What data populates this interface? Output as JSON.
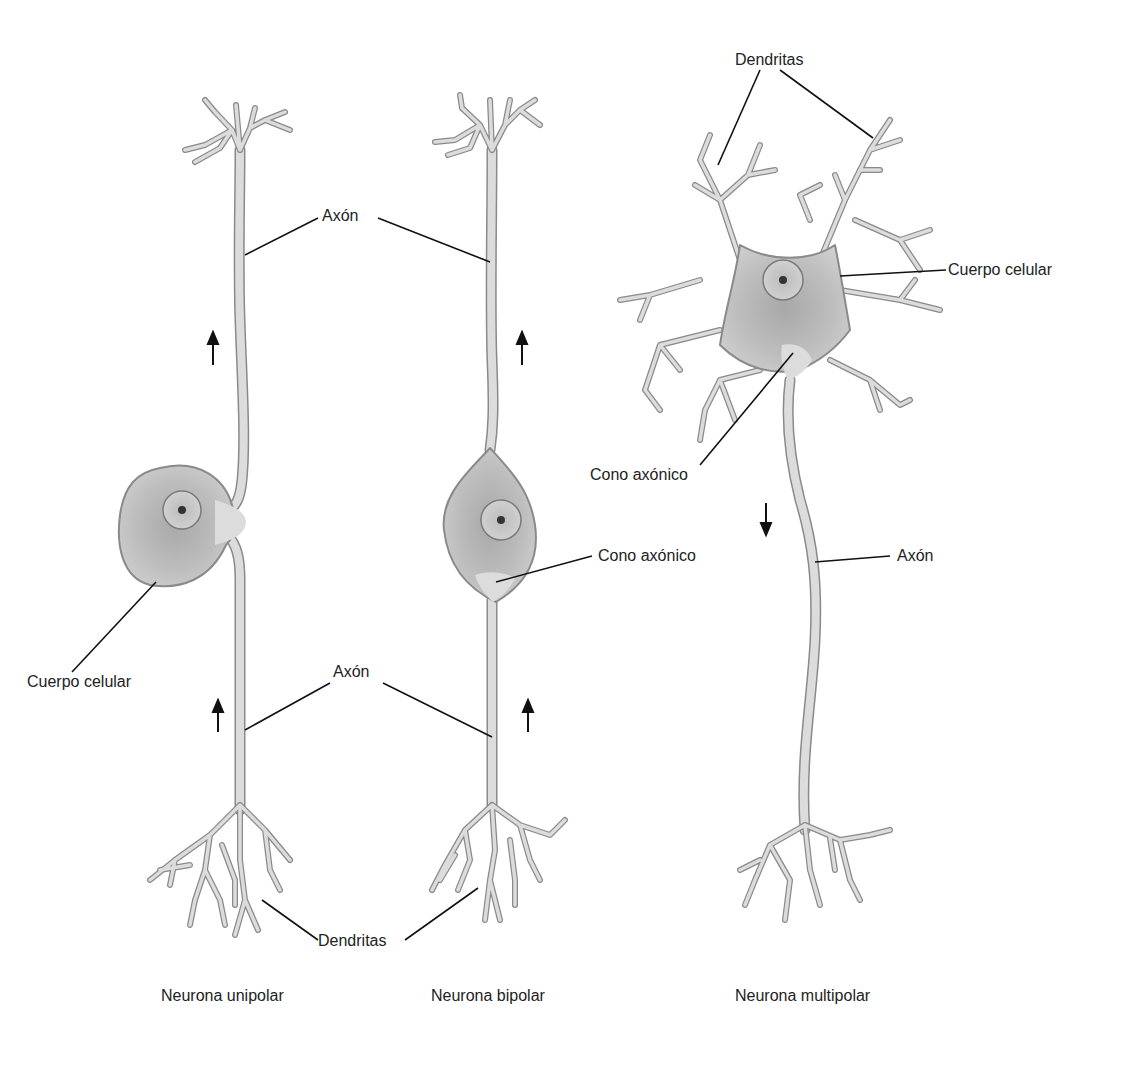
{
  "diagram": {
    "type": "neuron-types-illustration",
    "colors": {
      "membrane_fill": "#dcdcdc",
      "membrane_stroke": "#8a8a8a",
      "soma_fill": "#bdbdbd",
      "nucleus_fill": "#c9c9c9",
      "nucleolus": "#333333",
      "leader_line": "#111111",
      "text": "#222222",
      "background": "#ffffff"
    },
    "neurons": [
      {
        "id": "unipolar",
        "caption": "Neurona unipolar",
        "labels": {
          "axon_top": "Axón",
          "axon_bottom": "Axón",
          "soma": "Cuerpo celular",
          "dendrites": "Dendritas"
        },
        "arrows": [
          "up",
          "up"
        ]
      },
      {
        "id": "bipolar",
        "caption": "Neurona bipolar",
        "labels": {
          "axon_top": "Axón",
          "axon_bottom": "Axón",
          "hillock": "Cono axónico",
          "dendrites": "Dendritas"
        },
        "arrows": [
          "up",
          "up"
        ]
      },
      {
        "id": "multipolar",
        "caption": "Neurona multipolar",
        "labels": {
          "dendrites": "Dendritas",
          "soma": "Cuerpo celular",
          "hillock": "Cono axónico",
          "axon": "Axón"
        },
        "arrows": [
          "down"
        ]
      }
    ]
  },
  "labels": {
    "axon_shared_top": "Axón",
    "axon_shared_bottom": "Axón",
    "dendrites_shared_bottom": "Dendritas",
    "unipolar_soma": "Cuerpo celular",
    "bipolar_hillock": "Cono axónico",
    "multipolar_dendrites": "Dendritas",
    "multipolar_soma": "Cuerpo celular",
    "multipolar_hillock": "Cono axónico",
    "multipolar_axon": "Axón"
  },
  "captions": {
    "unipolar": "Neurona unipolar",
    "bipolar": "Neurona bipolar",
    "multipolar": "Neurona multipolar"
  }
}
